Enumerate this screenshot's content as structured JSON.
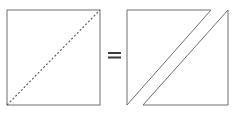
{
  "figure": {
    "title": "Square with diagonal equals two right triangles",
    "width": 239,
    "height": 113,
    "background_color": "#ffffff",
    "stroke_color": "#6e6e6e",
    "stroke_color_dark": "#555555",
    "stroke_width": 1,
    "dash_pattern": "2 2"
  },
  "left_shape": {
    "name": "square",
    "label": "",
    "x": 7,
    "y": 10,
    "width": 93,
    "height": 95,
    "outline_color": "#6e6e6e",
    "fill": "none",
    "diagonal": {
      "name": "dashed-diagonal",
      "style": "dashed",
      "from_x": 7,
      "from_y": 105,
      "to_x": 100,
      "to_y": 10,
      "color": "#555555"
    }
  },
  "operator": {
    "name": "equals-sign",
    "symbol": "=",
    "x": 108,
    "y": 52,
    "width": 13,
    "height": 6,
    "bar_thickness": 2,
    "bar_gap": 2,
    "color": "#3c3c3c"
  },
  "right_shape": {
    "name": "two-triangles",
    "bounds": {
      "x": 127,
      "y": 10,
      "width": 101,
      "height": 95
    },
    "gap": 15,
    "triangles": [
      {
        "name": "upper-left-triangle",
        "points": "127,10 211,10 127,105",
        "fill": "none",
        "outline_color": "#6e6e6e"
      },
      {
        "name": "lower-right-triangle",
        "points": "228,10 228,105 143,105",
        "fill": "none",
        "outline_color": "#6e6e6e"
      }
    ]
  }
}
